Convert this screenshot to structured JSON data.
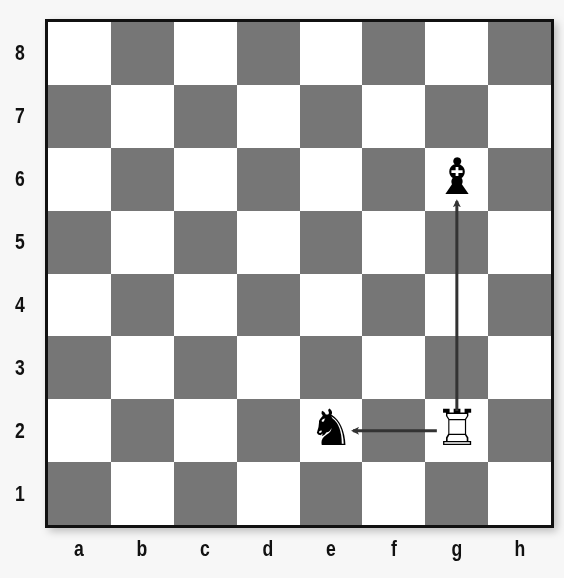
{
  "board": {
    "files": [
      "a",
      "b",
      "c",
      "d",
      "e",
      "f",
      "g",
      "h"
    ],
    "ranks": [
      "8",
      "7",
      "6",
      "5",
      "4",
      "3",
      "2",
      "1"
    ],
    "light_color": "#ffffff",
    "dark_color": "#767676",
    "border_color": "#111111"
  },
  "pieces": [
    {
      "square": "g6",
      "piece": "bishop",
      "color": "black",
      "glyph": "♝"
    },
    {
      "square": "g2",
      "piece": "rook",
      "color": "white",
      "glyph": "♖"
    },
    {
      "square": "e2",
      "piece": "knight",
      "color": "black",
      "glyph": "♞"
    }
  ],
  "arrows": [
    {
      "from": "g2",
      "to": "g6",
      "color": "#333333"
    },
    {
      "from": "g2",
      "to": "e2",
      "color": "#333333"
    }
  ]
}
